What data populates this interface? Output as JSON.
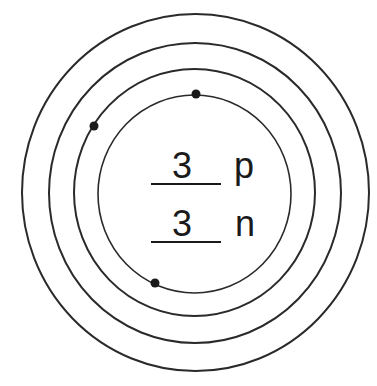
{
  "diagram": {
    "colors": {
      "line": "#2a2a2a",
      "electron": "#1a1a1a",
      "background": "#ffffff"
    },
    "shells": [
      {
        "name": "shell-1",
        "cx": 194.5,
        "cy": 194,
        "rx": 96.5,
        "ry": 99
      },
      {
        "name": "shell-2",
        "cx": 194.5,
        "cy": 192.5,
        "rx": 120.5,
        "ry": 123.5
      },
      {
        "name": "shell-3",
        "cx": 195,
        "cy": 193,
        "rx": 146,
        "ry": 150
      },
      {
        "name": "shell-4",
        "cx": 195.5,
        "cy": 192.5,
        "rx": 173.5,
        "ry": 178.5
      }
    ],
    "electrons": [
      {
        "shell": "shell-1",
        "x": 196,
        "y": 94
      },
      {
        "shell": "shell-2",
        "x": 94,
        "y": 126
      },
      {
        "shell": "shell-1",
        "x": 155,
        "y": 283
      }
    ],
    "nucleus": {
      "protons": {
        "count": "3",
        "symbol": "p"
      },
      "neutrons": {
        "count": "3",
        "symbol": "n"
      }
    }
  }
}
